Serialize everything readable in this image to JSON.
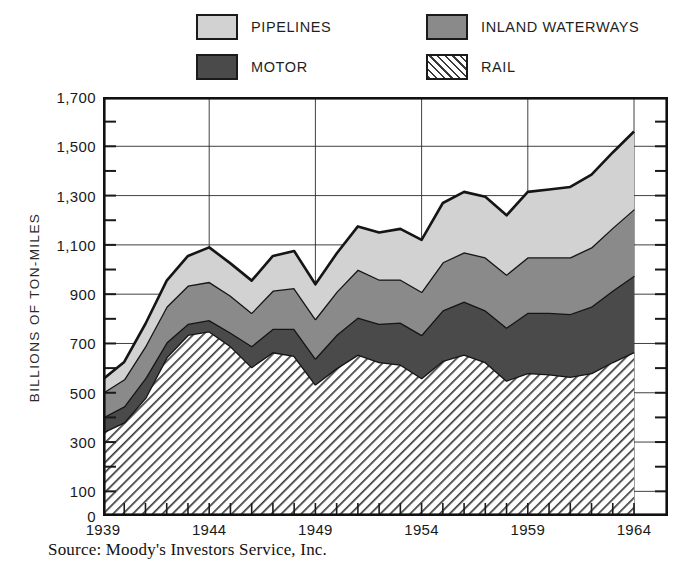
{
  "legend": {
    "items": [
      {
        "key": "pipelines",
        "label": "PIPELINES",
        "color": "#d2d2d2",
        "pattern": "solid"
      },
      {
        "key": "inland",
        "label": "INLAND WATERWAYS",
        "color": "#8a8a8a",
        "pattern": "solid"
      },
      {
        "key": "motor",
        "label": "MOTOR",
        "color": "#4a4a4a",
        "pattern": "solid"
      },
      {
        "key": "rail",
        "label": "RAIL",
        "color": "#ffffff",
        "pattern": "diagonal-hatch"
      }
    ]
  },
  "axes": {
    "ylabel": "BILLIONS OF TON-MILES",
    "ytick_labels": [
      "1,700",
      "1,500",
      "1,300",
      "1,100",
      "900",
      "700",
      "500",
      "300",
      "100",
      "0"
    ],
    "ytick_values": [
      1700,
      1500,
      1300,
      1100,
      900,
      700,
      500,
      300,
      100,
      0
    ],
    "xtick_labels": [
      "1939",
      "1944",
      "1949",
      "1954",
      "1959",
      "1964"
    ],
    "xtick_values": [
      1939,
      1944,
      1949,
      1954,
      1959,
      1964
    ]
  },
  "source": "Source: Moody's Investors Service, Inc.",
  "chart_data": {
    "type": "area",
    "title": "",
    "xlabel": "",
    "ylabel": "BILLIONS OF TON-MILES",
    "xlim": [
      1939,
      1964
    ],
    "ylim": [
      0,
      1700
    ],
    "ytick_step": 200,
    "yminor_step": 100,
    "grid": true,
    "legend_position": "top",
    "stacked": true,
    "stack_order": [
      "rail",
      "motor",
      "inland",
      "pipelines"
    ],
    "x": [
      1939,
      1940,
      1941,
      1942,
      1943,
      1944,
      1945,
      1946,
      1947,
      1948,
      1949,
      1950,
      1951,
      1952,
      1953,
      1954,
      1955,
      1956,
      1957,
      1958,
      1959,
      1960,
      1961,
      1962,
      1963,
      1964
    ],
    "series": [
      {
        "name": "RAIL",
        "color": "#ffffff",
        "pattern": "diagonal-hatch",
        "values": [
          340,
          380,
          480,
          645,
          735,
          750,
          690,
          605,
          665,
          650,
          535,
          600,
          655,
          625,
          615,
          560,
          630,
          655,
          625,
          550,
          580,
          575,
          565,
          580,
          625,
          665
        ]
      },
      {
        "name": "MOTOR",
        "color": "#4a4a4a",
        "pattern": "solid",
        "values": [
          60,
          65,
          80,
          60,
          45,
          45,
          55,
          85,
          95,
          110,
          105,
          135,
          150,
          155,
          170,
          175,
          205,
          215,
          210,
          215,
          245,
          250,
          255,
          270,
          290,
          310
        ]
      },
      {
        "name": "INLAND WATERWAYS",
        "color": "#8a8a8a",
        "pattern": "solid",
        "values": [
          100,
          110,
          130,
          145,
          155,
          155,
          150,
          135,
          155,
          165,
          160,
          175,
          195,
          180,
          175,
          175,
          195,
          200,
          215,
          215,
          225,
          225,
          230,
          240,
          255,
          270
        ]
      },
      {
        "name": "PIPELINES",
        "color": "#d2d2d2",
        "pattern": "solid",
        "values": [
          55,
          70,
          90,
          105,
          120,
          140,
          130,
          130,
          140,
          150,
          140,
          155,
          175,
          190,
          205,
          210,
          240,
          245,
          245,
          240,
          265,
          275,
          285,
          295,
          305,
          315
        ]
      }
    ],
    "totals": [
      555,
      625,
      780,
      955,
      1055,
      1090,
      1025,
      955,
      1055,
      1075,
      940,
      1065,
      1175,
      1150,
      1165,
      1120,
      1270,
      1315,
      1295,
      1220,
      1315,
      1325,
      1335,
      1385,
      1475,
      1560
    ]
  }
}
